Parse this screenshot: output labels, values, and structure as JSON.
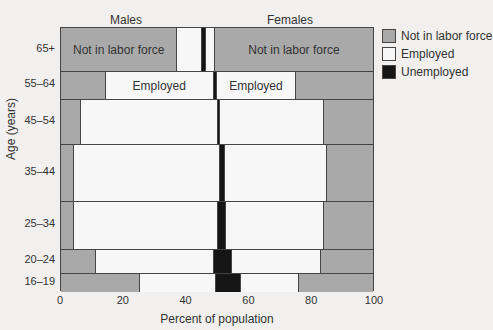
{
  "chart_data": {
    "type": "bar",
    "subtype": "stacked-horizontal-percent",
    "title": "",
    "panel_labels": [
      "Males",
      "Females"
    ],
    "xlabel": "Percent of population",
    "ylabel": "Age (years)",
    "xlim": [
      0,
      100
    ],
    "xticks": [
      0,
      20,
      40,
      60,
      80,
      100
    ],
    "legend": {
      "position": "right",
      "entries": [
        {
          "label": "Not in labor force",
          "color": "#a9a9a9"
        },
        {
          "label": "Employed",
          "color": "#f7f7f7"
        },
        {
          "label": "Unemployed",
          "color": "#151515"
        }
      ]
    },
    "categories": [
      "65+",
      "55–64",
      "45–54",
      "35–44",
      "25–34",
      "20–24",
      "16–19"
    ],
    "row_heights_px": [
      43,
      28,
      45,
      57,
      48,
      24,
      19
    ],
    "series": [
      {
        "name": "Males – Not in labor force",
        "class": "nilf",
        "values": [
          37,
          14,
          6,
          4,
          4,
          11,
          25
        ]
      },
      {
        "name": "Males – Employed",
        "class": "emp",
        "values": [
          8,
          34.7,
          44,
          46.6,
          46,
          37.7,
          24.4
        ]
      },
      {
        "name": "Unemployed (males + females)",
        "class": "unemp",
        "values": [
          1,
          1,
          0.6,
          1.6,
          2.5,
          5.8,
          7.9
        ]
      },
      {
        "name": "Females – Employed",
        "class": "emp",
        "values": [
          3,
          25.3,
          33.4,
          32.8,
          31.5,
          28.5,
          18.7
        ]
      },
      {
        "name": "Females – Not in labor force",
        "class": "nilf",
        "values": [
          51,
          25,
          16,
          15,
          16,
          17,
          24
        ]
      }
    ],
    "annotations": [
      {
        "row": "65+",
        "segment": 0,
        "text": "Not in labor force"
      },
      {
        "row": "65+",
        "segment": 4,
        "text": "Not in labor force"
      },
      {
        "row": "55–64",
        "segment": 1,
        "text": "Employed"
      },
      {
        "row": "55–64",
        "segment": 3,
        "text": "Employed"
      }
    ],
    "grid": false
  }
}
